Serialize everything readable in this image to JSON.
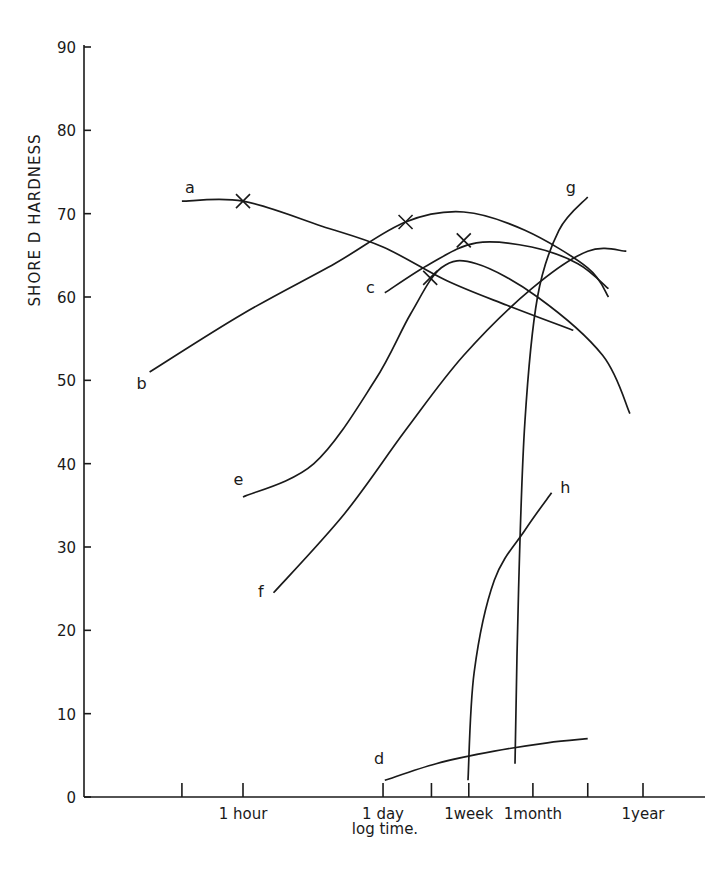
{
  "chart_data": {
    "type": "line",
    "title": "",
    "xlabel": "log time.",
    "ylabel": "SHORE D HARDNESS",
    "ylim": [
      0,
      90
    ],
    "yticks": [
      0,
      10,
      20,
      30,
      40,
      50,
      60,
      70,
      80,
      90
    ],
    "x_scale": "log (hours)",
    "xlim_hours": [
      0.05,
      30000
    ],
    "xticks": [
      {
        "label": "",
        "hours": 0.25
      },
      {
        "label": "1 hour",
        "hours": 1
      },
      {
        "label": "1 day",
        "hours": 24
      },
      {
        "label": "",
        "hours": 72
      },
      {
        "label": "1week",
        "hours": 168
      },
      {
        "label": "1month",
        "hours": 720
      },
      {
        "label": "",
        "hours": 2500
      },
      {
        "label": "1year",
        "hours": 8760
      }
    ],
    "grid": false,
    "legend": "inline curve labels",
    "series": [
      {
        "name": "a",
        "points": [
          [
            0.25,
            71.5
          ],
          [
            1,
            71.5
          ],
          [
            6,
            68.5
          ],
          [
            24,
            66
          ],
          [
            100,
            62
          ],
          [
            400,
            59
          ],
          [
            1800,
            56
          ]
        ],
        "markers": [
          [
            1,
            71.5
          ]
        ]
      },
      {
        "name": "b",
        "points": [
          [
            0.12,
            51
          ],
          [
            1,
            58
          ],
          [
            8,
            64
          ],
          [
            40,
            69
          ],
          [
            150,
            70.2
          ],
          [
            600,
            68
          ],
          [
            2500,
            63.5
          ],
          [
            4000,
            60
          ]
        ],
        "markers": [
          [
            40,
            69
          ]
        ]
      },
      {
        "name": "c",
        "points": [
          [
            25,
            60.5
          ],
          [
            70,
            64
          ],
          [
            200,
            66.5
          ],
          [
            700,
            66
          ],
          [
            2000,
            64
          ],
          [
            4000,
            61
          ]
        ],
        "markers": [
          [
            150,
            66.8
          ]
        ]
      },
      {
        "name": "e",
        "points": [
          [
            1,
            36
          ],
          [
            5,
            40
          ],
          [
            20,
            50
          ],
          [
            45,
            58
          ],
          [
            90,
            63.5
          ],
          [
            200,
            64
          ],
          [
            800,
            60
          ],
          [
            3500,
            53
          ],
          [
            6500,
            46
          ]
        ],
        "markers": [
          [
            70,
            62.3
          ]
        ]
      },
      {
        "name": "f",
        "points": [
          [
            2,
            24.5
          ],
          [
            10,
            34
          ],
          [
            40,
            44
          ],
          [
            150,
            53
          ],
          [
            700,
            61
          ],
          [
            2500,
            65.5
          ],
          [
            6000,
            65.5
          ]
        ],
        "markers": []
      },
      {
        "name": "g",
        "points": [
          [
            480,
            4
          ],
          [
            520,
            25
          ],
          [
            600,
            45
          ],
          [
            800,
            60
          ],
          [
            1300,
            68
          ],
          [
            2500,
            72
          ]
        ],
        "markers": []
      },
      {
        "name": "h",
        "points": [
          [
            165,
            2
          ],
          [
            190,
            15
          ],
          [
            300,
            26
          ],
          [
            600,
            32
          ],
          [
            1100,
            36.5
          ]
        ],
        "markers": []
      },
      {
        "name": "d",
        "points": [
          [
            25,
            2
          ],
          [
            80,
            4
          ],
          [
            300,
            5.5
          ],
          [
            1000,
            6.5
          ],
          [
            2500,
            7
          ]
        ],
        "markers": []
      }
    ],
    "curve_label_positions": {
      "a": [
        0.3,
        72.5
      ],
      "b": [
        0.1,
        49
      ],
      "c": [
        18,
        60.5
      ],
      "e": [
        0.9,
        37.5
      ],
      "f": [
        1.5,
        24
      ],
      "g": [
        1700,
        72.5
      ],
      "h": [
        1500,
        36.5
      ],
      "d": [
        22,
        4
      ]
    }
  }
}
